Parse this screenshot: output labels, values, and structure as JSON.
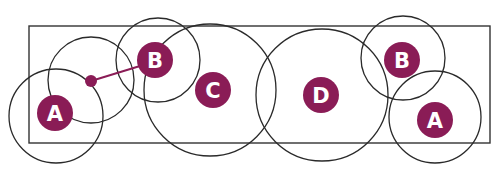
{
  "diagram": {
    "accent_color": "#8a1c56",
    "line_color": "#2a2a2a",
    "frame": {
      "x": 29,
      "y": 26,
      "width": 461,
      "height": 117
    },
    "circles": [
      {
        "id": "circle-a-left",
        "cx": 56,
        "cy": 116,
        "r": 47
      },
      {
        "id": "circle-dot",
        "cx": 91,
        "cy": 80,
        "r": 43
      },
      {
        "id": "circle-b-left",
        "cx": 158,
        "cy": 60,
        "r": 42
      },
      {
        "id": "circle-c",
        "cx": 210,
        "cy": 90,
        "r": 66
      },
      {
        "id": "circle-d",
        "cx": 322,
        "cy": 95,
        "r": 66
      },
      {
        "id": "circle-b-right",
        "cx": 403,
        "cy": 58,
        "r": 42
      },
      {
        "id": "circle-a-right",
        "cx": 435,
        "cy": 117,
        "r": 46
      }
    ],
    "badges": [
      {
        "id": "badge-a-left",
        "label": "A",
        "cx": 55,
        "cy": 113,
        "r": 18
      },
      {
        "id": "badge-b-left",
        "label": "B",
        "cx": 155,
        "cy": 60,
        "r": 18
      },
      {
        "id": "badge-c",
        "label": "C",
        "cx": 213,
        "cy": 90,
        "r": 18
      },
      {
        "id": "badge-d",
        "label": "D",
        "cx": 321,
        "cy": 95,
        "r": 18
      },
      {
        "id": "badge-b-right",
        "label": "B",
        "cx": 402,
        "cy": 60,
        "r": 18
      },
      {
        "id": "badge-a-right",
        "label": "A",
        "cx": 435,
        "cy": 120,
        "r": 18
      }
    ],
    "connector": {
      "dot": {
        "cx": 91,
        "cy": 81,
        "r": 6
      },
      "line": {
        "x1": 91,
        "y1": 81,
        "x2": 140,
        "y2": 66
      }
    }
  }
}
